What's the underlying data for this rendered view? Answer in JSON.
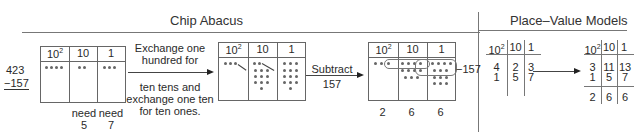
{
  "sections": {
    "chip_abacus_title": "Chip Abacus",
    "place_value_title": "Place–Value Models"
  },
  "abacus_headers": {
    "hundreds": "10",
    "hundreds_exp": "2",
    "tens": "10",
    "ones": "1"
  },
  "step1": {
    "minuend": "423",
    "subtrahend": "−157",
    "chips": {
      "hundreds": 4,
      "tens": 2,
      "ones": 3
    },
    "need_tens_label": "need",
    "need_tens_value": "5",
    "need_ones_label": "need",
    "need_ones_value": "7"
  },
  "exchange_text": {
    "line1": "Exchange one",
    "line2": "hundred for",
    "line3": "ten tens and",
    "line4": "exchange one ten",
    "line5": "for ten ones."
  },
  "step2": {
    "chips": {
      "hundreds": 3,
      "tens": 12,
      "ones": 13
    }
  },
  "subtract_text": {
    "line1": "Subtract",
    "line2": "157"
  },
  "step3": {
    "remove_label": "−157",
    "results": {
      "hundreds": "2",
      "tens": "6",
      "ones": "6"
    }
  },
  "place_value_1": {
    "headers": [
      "10",
      "10",
      "1"
    ],
    "hundreds_exp": "2",
    "row1": [
      "4",
      "2",
      "3"
    ],
    "row2": [
      "1",
      "5",
      "7"
    ]
  },
  "place_value_2": {
    "headers": [
      "10",
      "10",
      "1"
    ],
    "hundreds_exp": "2",
    "row1": [
      "3",
      "11",
      "13"
    ],
    "row2": [
      "1",
      "5",
      "7"
    ],
    "result": [
      "2",
      "6",
      "6"
    ]
  }
}
